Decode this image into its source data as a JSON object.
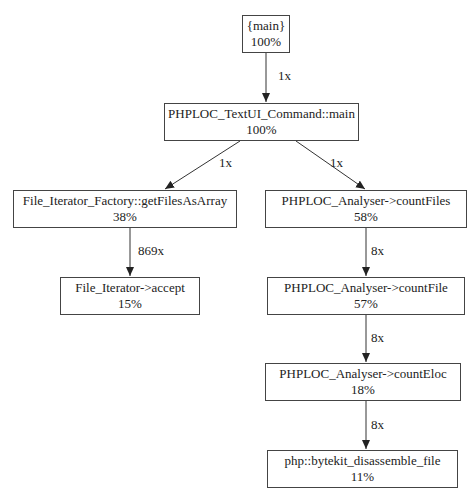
{
  "graph": {
    "type": "call-graph",
    "nodes": [
      {
        "id": "main",
        "label": "{main}",
        "percent": "100%"
      },
      {
        "id": "textui",
        "label": "PHPLOC_TextUI_Command::main",
        "percent": "100%"
      },
      {
        "id": "factory",
        "label": "File_Iterator_Factory::getFilesAsArray",
        "percent": "38%"
      },
      {
        "id": "countFiles",
        "label": "PHPLOC_Analyser->countFiles",
        "percent": "58%"
      },
      {
        "id": "accept",
        "label": "File_Iterator->accept",
        "percent": "15%"
      },
      {
        "id": "countFile",
        "label": "PHPLOC_Analyser->countFile",
        "percent": "57%"
      },
      {
        "id": "countEloc",
        "label": "PHPLOC_Analyser->countEloc",
        "percent": "18%"
      },
      {
        "id": "bytekit",
        "label": "php::bytekit_disassemble_file",
        "percent": "11%"
      }
    ],
    "edges": [
      {
        "from": "main",
        "to": "textui",
        "label": "1x"
      },
      {
        "from": "textui",
        "to": "factory",
        "label": "1x"
      },
      {
        "from": "textui",
        "to": "countFiles",
        "label": "1x"
      },
      {
        "from": "factory",
        "to": "accept",
        "label": "869x"
      },
      {
        "from": "countFiles",
        "to": "countFile",
        "label": "8x"
      },
      {
        "from": "countFile",
        "to": "countEloc",
        "label": "8x"
      },
      {
        "from": "countEloc",
        "to": "bytekit",
        "label": "8x"
      }
    ]
  },
  "colors": {
    "border": "#444444",
    "edge": "#333333",
    "background": "#ffffff"
  }
}
